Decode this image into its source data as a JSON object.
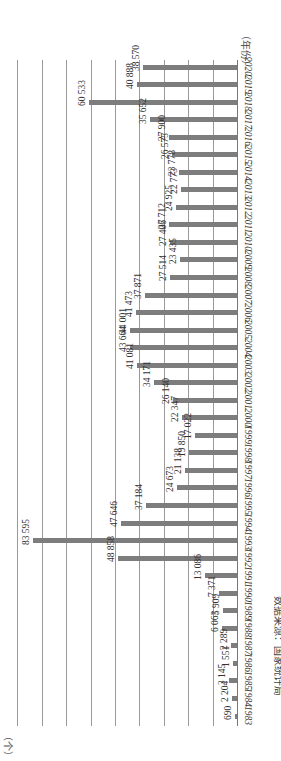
{
  "chart_data": {
    "type": "bar",
    "orientation": "horizontal-rotated (page rotated 90°; bars extend leftward from baseline on right)",
    "title": "",
    "xlabel": "（年份）",
    "ylabel": "（个）",
    "categories": [
      "1983",
      "1984",
      "1985",
      "1986",
      "1987",
      "1988",
      "1989",
      "1990",
      "1991",
      "1992",
      "1993",
      "1994",
      "1995",
      "1996",
      "1997",
      "1998",
      "1999",
      "2000",
      "2001",
      "2002",
      "2003",
      "2004",
      "2005",
      "2006",
      "2007",
      "2008",
      "2009",
      "2010",
      "2011",
      "2012",
      "2013",
      "2014",
      "2015",
      "2016",
      "2017",
      "2018",
      "2019",
      "2020"
    ],
    "values": [
      690,
      2204,
      3145,
      1551,
      2289,
      6063,
      5909,
      7371,
      13086,
      48858,
      83595,
      47646,
      37184,
      24673,
      21138,
      19850,
      17022,
      22347,
      26140,
      34171,
      41081,
      43664,
      44001,
      41473,
      37871,
      27514,
      23435,
      27406,
      27712,
      24925,
      22773,
      23778,
      26575,
      27900,
      35652,
      60533,
      40888,
      38570
    ],
    "value_labels": [
      "690",
      "2 204",
      "3 145",
      "1 551",
      "2 289",
      "6 063",
      "5 909",
      "7 371",
      "13 086",
      "48 858",
      "83 595",
      "47 646",
      "37 184",
      "24 673",
      "21 138",
      "19 850",
      "17 022",
      "22 347",
      "26 140",
      "34 171",
      "41 081",
      "43 664",
      "44 001",
      "41 473",
      "37 871",
      "27 514",
      "23 435",
      "27 406",
      "27 712",
      "24 925",
      "22 773",
      "23 778",
      "26 575",
      "27 900",
      "35 652",
      "60 533",
      "40 888",
      "38 570"
    ],
    "ylim": [
      0,
      90000
    ],
    "grid": true,
    "grid_step": 10000,
    "legend": null,
    "source_note": "数据来源：国家统计局"
  },
  "axis": {
    "unit_label": "（个）",
    "category_label": "（年份）"
  },
  "footer": {
    "source": "数据来源：国家统计局"
  },
  "colors": {
    "bar": "#7d7d7d",
    "grid": "#9a9a9a",
    "text": "#333333"
  }
}
